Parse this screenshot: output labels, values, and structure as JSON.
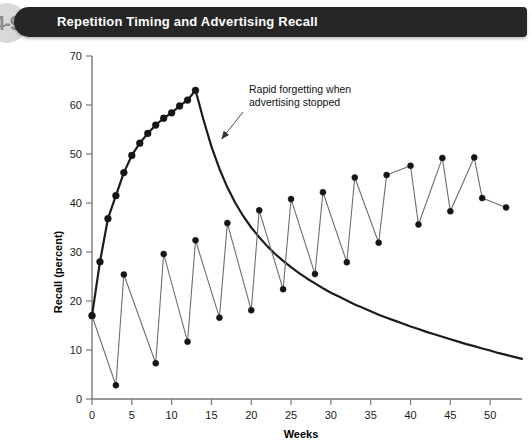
{
  "header": {
    "figure_number": "4-9",
    "title": "Repetition Timing and Advertising Recall"
  },
  "chart_data": {
    "type": "line",
    "title": "Repetition Timing and Advertising Recall",
    "xlabel": "Weeks",
    "ylabel": "Recall (percent)",
    "xlim": [
      0,
      54
    ],
    "ylim": [
      0,
      70
    ],
    "xticks": [
      0,
      5,
      10,
      15,
      20,
      25,
      30,
      35,
      40,
      45,
      50
    ],
    "yticks": [
      0,
      10,
      20,
      30,
      40,
      50,
      60,
      70
    ],
    "grid": false,
    "legend": "none",
    "annotations": [
      {
        "text_line1": "Rapid forgetting when",
        "text_line2": "advertising stopped",
        "points_to_x": 15.5,
        "points_to_y": 52
      }
    ],
    "series": [
      {
        "name": "Continuous advertising then stopped",
        "style": "thick-line-with-markers",
        "x": [
          0,
          1,
          2,
          3,
          4,
          5,
          6,
          7,
          8,
          9,
          10,
          11,
          12,
          13
        ],
        "y": [
          17.0,
          28.0,
          36.8,
          41.5,
          46.2,
          49.7,
          52.2,
          54.2,
          55.9,
          57.3,
          58.4,
          59.8,
          61.0,
          63.0
        ]
      },
      {
        "name": "Forgetting decay after advertising stopped",
        "style": "thick-line-no-markers",
        "x": [
          13,
          14,
          15,
          16,
          17,
          18,
          19,
          20,
          21,
          22,
          23,
          24,
          25,
          26,
          27,
          28,
          29,
          30,
          31,
          32,
          33,
          34,
          35,
          36,
          37,
          38,
          39,
          40,
          41,
          42,
          43,
          44,
          45,
          46,
          47,
          48,
          49,
          50,
          51,
          52,
          53,
          54
        ],
        "y": [
          63.0,
          57.0,
          51.5,
          47.0,
          43.2,
          40.0,
          37.3,
          35.0,
          33.0,
          31.2,
          29.6,
          28.2,
          26.9,
          25.7,
          24.6,
          23.6,
          22.6,
          21.7,
          20.9,
          20.1,
          19.3,
          18.6,
          17.9,
          17.2,
          16.6,
          16.0,
          15.4,
          14.8,
          14.3,
          13.7,
          13.2,
          12.7,
          12.2,
          11.7,
          11.2,
          10.8,
          10.3,
          9.9,
          9.4,
          9.0,
          8.6,
          8.2
        ]
      },
      {
        "name": "Pulsed (flighted) advertising",
        "style": "thin-line-with-markers",
        "x": [
          0,
          3,
          4,
          8,
          9,
          12,
          13,
          16,
          17,
          20,
          21,
          24,
          25,
          28,
          29,
          32,
          33,
          36,
          37,
          40,
          41,
          44,
          45,
          48,
          49,
          52
        ],
        "y": [
          17.0,
          2.8,
          25.4,
          7.3,
          29.6,
          11.7,
          32.4,
          16.6,
          35.9,
          18.1,
          38.5,
          22.4,
          40.8,
          25.5,
          42.2,
          27.9,
          45.2,
          31.9,
          45.7,
          47.6,
          35.6,
          49.2,
          38.3,
          49.3,
          41.0,
          39.1
        ]
      }
    ]
  }
}
